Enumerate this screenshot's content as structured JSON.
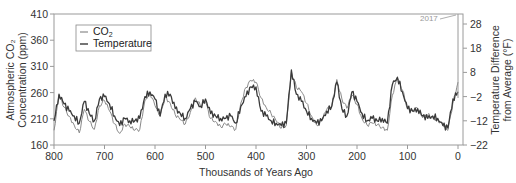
{
  "chart_data": {
    "type": "line",
    "title": "",
    "xlabel": "Thousands of Years Ago",
    "ylabel": "Atmospheric CO2 Concentration (ppm)",
    "ylabel_line1": "Atmospheric CO₂",
    "ylabel_line2": "Concentration (ppm)",
    "y2label": "Temperature Difference from Average (°F)",
    "y2label_line1": "Temperature Difference",
    "y2label_line2": "from Average (°F)",
    "xlim": [
      800,
      0
    ],
    "ylim": [
      160,
      410
    ],
    "y2lim": [
      -22,
      28
    ],
    "x_ticks": [
      800,
      700,
      600,
      500,
      400,
      300,
      200,
      100,
      0
    ],
    "y_ticks": [
      160,
      210,
      260,
      310,
      360,
      410
    ],
    "y2_ticks": [
      -22,
      -12,
      -2,
      8,
      18,
      28
    ],
    "grid": false,
    "legend_position": "upper left",
    "legend": [
      "CO₂",
      "Temperature"
    ],
    "annotations": [
      {
        "text": "2017",
        "x": 0,
        "y": 407
      }
    ],
    "x": [
      800,
      790,
      780,
      770,
      760,
      750,
      740,
      730,
      720,
      710,
      700,
      690,
      680,
      670,
      660,
      650,
      640,
      630,
      620,
      610,
      600,
      590,
      580,
      570,
      560,
      550,
      540,
      530,
      520,
      510,
      500,
      490,
      480,
      470,
      460,
      450,
      440,
      430,
      420,
      410,
      400,
      390,
      380,
      370,
      360,
      350,
      340,
      330,
      320,
      310,
      300,
      290,
      280,
      270,
      260,
      250,
      240,
      230,
      220,
      210,
      200,
      190,
      180,
      170,
      160,
      150,
      140,
      130,
      120,
      110,
      100,
      90,
      80,
      70,
      60,
      50,
      40,
      30,
      20,
      10,
      0
    ],
    "series": [
      {
        "name": "CO₂",
        "axis": "left",
        "color": "#8a8a8a",
        "values": [
          188,
          255,
          232,
          215,
          198,
          183,
          228,
          205,
          190,
          235,
          245,
          225,
          200,
          182,
          200,
          195,
          188,
          190,
          245,
          260,
          235,
          215,
          252,
          240,
          218,
          208,
          200,
          222,
          250,
          235,
          242,
          210,
          205,
          195,
          200,
          195,
          190,
          240,
          270,
          283,
          280,
          250,
          232,
          220,
          206,
          192,
          198,
          300,
          270,
          262,
          240,
          215,
          198,
          206,
          228,
          235,
          285,
          248,
          230,
          255,
          238,
          210,
          198,
          202,
          198,
          194,
          188,
          255,
          288,
          265,
          230,
          225,
          230,
          212,
          218,
          212,
          208,
          198,
          188,
          240,
          280
        ]
      },
      {
        "name": "Temperature",
        "axis": "right",
        "color": "#3a3a3a",
        "values": [
          -12,
          -1,
          -5,
          -8,
          -10,
          -13,
          -4,
          -9,
          -12,
          -3,
          -2,
          -5,
          -10,
          -14,
          -11,
          -12,
          -12,
          -11,
          -2,
          0,
          -3,
          -10,
          -1,
          -1,
          -7,
          -9,
          -11,
          -7,
          -4,
          -6,
          -3,
          -9,
          -10,
          -11,
          -11,
          -10,
          -13,
          -6,
          -2,
          2,
          2,
          -8,
          -10,
          -12,
          -13,
          -14,
          -13,
          9,
          -1,
          -4,
          -8,
          -11,
          -13,
          -12,
          -8,
          -6,
          4,
          -7,
          -10,
          0,
          -4,
          -9,
          -12,
          -11,
          -12,
          -11,
          -13,
          3,
          6,
          0,
          -7,
          -8,
          -7,
          -10,
          -11,
          -10,
          -11,
          -14,
          -15,
          -3,
          0
        ]
      }
    ],
    "line_2017": {
      "from_ppm": 280,
      "to_ppm": 407
    }
  },
  "legend": {
    "co2_label": "CO",
    "co2_sub": "2",
    "temp_label": "Temperature"
  },
  "annotation": {
    "label": "2017"
  }
}
